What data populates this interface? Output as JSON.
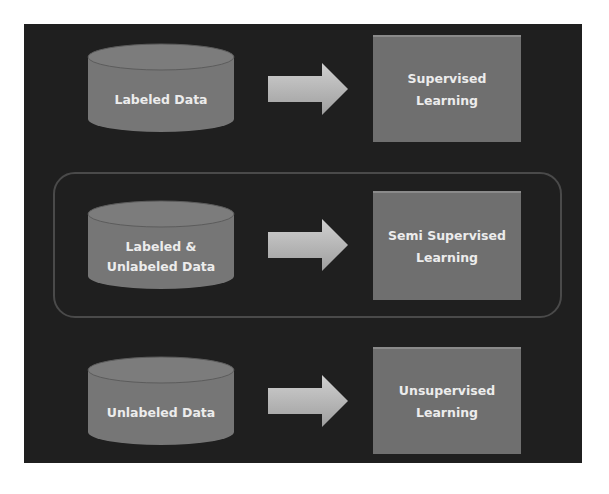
{
  "colors": {
    "background": "#ffffff",
    "panel": "#1f1f1f",
    "group_border": "#4a4a4a",
    "cylinder": "#767676",
    "box": "#6f6f6f",
    "arrow": "#b8b8b8",
    "text": "#ececec"
  },
  "rows": [
    {
      "data_label": "Labeled Data",
      "method_label": "Supervised Learning",
      "highlighted": false
    },
    {
      "data_label": "Labeled & Unlabeled Data",
      "method_label": "Semi Supervised Learning",
      "highlighted": true
    },
    {
      "data_label": "Unlabeled Data",
      "method_label": "Unsupervised Learning",
      "highlighted": false
    }
  ],
  "icons": {
    "data_store": "database-cylinder-icon",
    "flow": "arrow-right-icon"
  }
}
